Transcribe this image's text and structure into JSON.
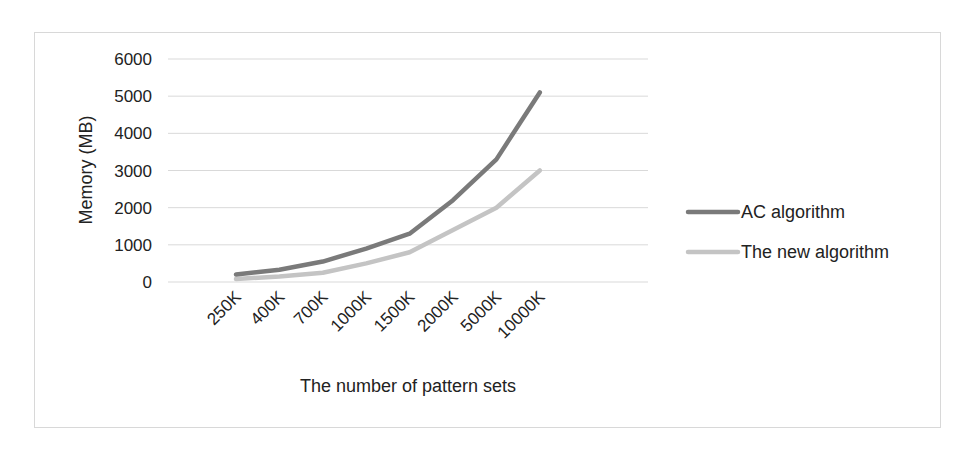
{
  "chart_data": {
    "type": "line",
    "title": "",
    "xlabel": "The number of pattern sets",
    "ylabel": "Memory (MB)",
    "categories": [
      "250K",
      "400K",
      "700K",
      "1000K",
      "1500K",
      "2000K",
      "5000K",
      "10000K"
    ],
    "series": [
      {
        "name": "AC algorithm",
        "color": "#7a7a7a",
        "values": [
          200,
          330,
          550,
          900,
          1300,
          2200,
          3300,
          5100
        ]
      },
      {
        "name": "The new algorithm",
        "color": "#c4c4c4",
        "values": [
          80,
          150,
          250,
          500,
          800,
          1400,
          2000,
          3000
        ]
      }
    ],
    "ylim": [
      0,
      6000
    ],
    "yticks": [
      0,
      1000,
      2000,
      3000,
      4000,
      5000,
      6000
    ],
    "grid": true,
    "legend_position": "right"
  },
  "colors": {
    "grid": "#d9d9d9",
    "border": "#d8d8d8",
    "text": "#222222"
  }
}
